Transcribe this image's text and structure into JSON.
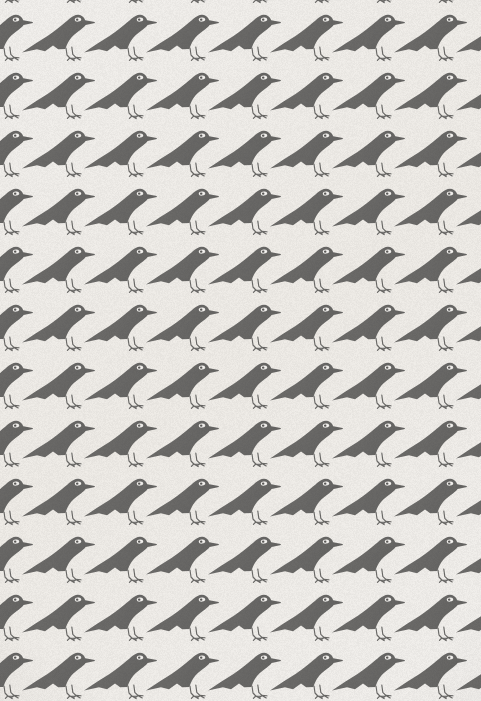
{
  "artwork": {
    "title": "Repeating Bird Wallpaper Pattern",
    "subject": "crow-silhouette",
    "medium": "printed paper",
    "orientation": "portrait",
    "alt_text": "A seamless tiled wallpaper pattern of gray crow silhouettes facing right on an off-white paper ground"
  },
  "canvas": {
    "width": 481,
    "height": 701
  },
  "palette": {
    "background": "#f2f0ed",
    "background_warm": "#efece7",
    "bird_fill": "#6f6e6c",
    "bird_fill_dark": "#5f5e5c",
    "bird_edge": "#7b7a78",
    "eye_white": "#f4f2ef",
    "eye_pupil": "#5a5957",
    "leg_stroke": "#6a6967",
    "grain": "#8a8784"
  },
  "pattern": {
    "type": "grid-tile",
    "motif": "bird",
    "tile_width": 62,
    "tile_height": 58,
    "row_offset_x": 0,
    "columns": 9,
    "rows": 14,
    "origin_x": -18,
    "origin_y": -40,
    "seamless": true,
    "bleeds_edges": true,
    "facing": "right",
    "top_row_cropped": true,
    "bottom_row_cropped": true
  },
  "motif": {
    "name": "bird",
    "parts": [
      "head",
      "beak",
      "eye",
      "breast",
      "wing",
      "tail",
      "legs",
      "feet"
    ],
    "eye_count": 1,
    "leg_count": 2,
    "toes_per_foot": 3,
    "body_length": 58,
    "body_height": 40,
    "tail_direction": "down-left",
    "beak_direction": "right"
  },
  "texture": {
    "grain": "print-halftone-noise",
    "grain_opacity": 0.5,
    "vignette": "soft-edge-darkening"
  }
}
